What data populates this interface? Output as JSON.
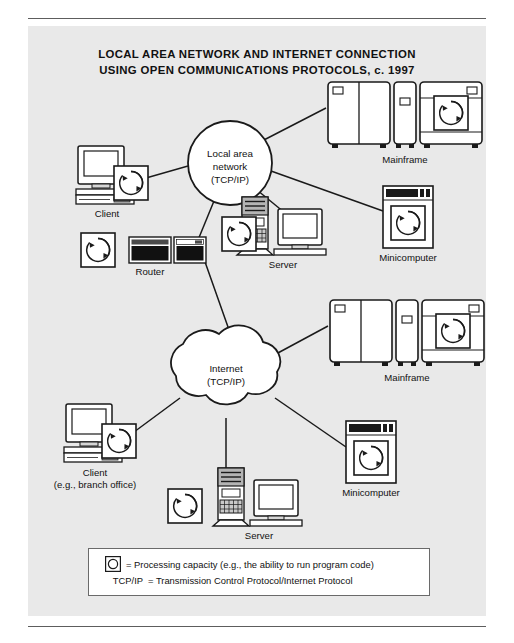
{
  "figure": {
    "title_line_1": "LOCAL AREA NETWORK AND INTERNET CONNECTION",
    "title_line_2": "USING OPEN COMMUNICATIONS PROTOCOLS, c. 1997",
    "background_color": "#e9e9e9",
    "line_color": "#1a1a1a",
    "text_color": "#111111"
  },
  "lan": {
    "shape": "circle",
    "label_line_1": "Local area",
    "label_line_2": "network",
    "label_line_3": "(TCP/IP)"
  },
  "internet": {
    "shape": "cloud",
    "label_line_1": "Internet",
    "label_line_2": "(TCP/IP)"
  },
  "nodes": {
    "lan_client": {
      "label": "Client",
      "icon": "desktop-computer-icon",
      "has_processing": true
    },
    "lan_router": {
      "label": "Router",
      "icon": "router-icon",
      "has_processing": true
    },
    "lan_server": {
      "label": "Server",
      "icon": "server-tower-icon",
      "has_processing": true
    },
    "lan_mainframe": {
      "label": "Mainframe",
      "icon": "mainframe-icon",
      "has_processing": true
    },
    "lan_minicomputer": {
      "label": "Minicomputer",
      "icon": "minicomputer-icon",
      "has_processing": true
    },
    "net_client": {
      "label_line_1": "Client",
      "label_line_2": "(e.g., branch office)",
      "icon": "desktop-computer-icon",
      "has_processing": true
    },
    "net_server": {
      "label": "Server",
      "icon": "server-tower-icon",
      "has_processing": true
    },
    "net_mainframe": {
      "label": "Mainframe",
      "icon": "mainframe-icon",
      "has_processing": true
    },
    "net_minicomputer": {
      "label": "Minicomputer",
      "icon": "minicomputer-icon",
      "has_processing": true
    }
  },
  "legend": {
    "row1_key": "",
    "row1_icon": "processing-capacity-icon",
    "row1_text": "= Processing capacity (e.g., the ability to run program code)",
    "row2_key": "TCP/IP",
    "row2_text": "= Transmission Control Protocol/Internet Protocol"
  }
}
